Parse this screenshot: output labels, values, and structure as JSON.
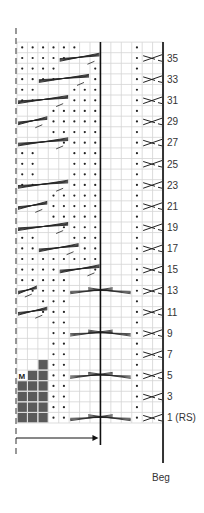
{
  "chart": {
    "columns": 14,
    "rows": 36,
    "grid_origin": {
      "x": 17,
      "y": 423
    },
    "cell_w": 10.43,
    "cell_h": 10.58,
    "divider_after_col": 8,
    "colors": {
      "grid": "#d4d4d4",
      "ink": "#222222",
      "gray_fill": "#5a5a5a"
    },
    "row_labels": [
      {
        "row": 1,
        "text": "1 (RS)"
      },
      {
        "row": 3,
        "text": "3"
      },
      {
        "row": 5,
        "text": "5"
      },
      {
        "row": 7,
        "text": "7"
      },
      {
        "row": 9,
        "text": "9"
      },
      {
        "row": 11,
        "text": "11"
      },
      {
        "row": 13,
        "text": "13"
      },
      {
        "row": 15,
        "text": "15"
      },
      {
        "row": 17,
        "text": "17"
      },
      {
        "row": 19,
        "text": "19"
      },
      {
        "row": 21,
        "text": "21"
      },
      {
        "row": 23,
        "text": "23"
      },
      {
        "row": 25,
        "text": "25"
      },
      {
        "row": 27,
        "text": "27"
      },
      {
        "row": 29,
        "text": "29"
      },
      {
        "row": 31,
        "text": "31"
      },
      {
        "row": 33,
        "text": "33"
      },
      {
        "row": 35,
        "text": "35"
      }
    ],
    "beg_label": "Beg",
    "marker_label": "M",
    "gray_cells": [
      [
        1,
        1
      ],
      [
        1,
        2
      ],
      [
        1,
        3
      ],
      [
        2,
        1
      ],
      [
        2,
        2
      ],
      [
        2,
        3
      ],
      [
        3,
        1
      ],
      [
        3,
        2
      ],
      [
        3,
        3
      ],
      [
        4,
        1
      ],
      [
        4,
        2
      ],
      [
        4,
        3
      ],
      [
        5,
        2
      ],
      [
        5,
        3
      ],
      [
        6,
        3
      ]
    ],
    "marker_cell": [
      5,
      1
    ],
    "dots": {
      "1": [
        4,
        5,
        12
      ],
      "2": [
        4,
        5,
        12
      ],
      "3": [
        4,
        5,
        12
      ],
      "4": [
        4,
        5,
        12
      ],
      "5": [
        4,
        5,
        12
      ],
      "6": [
        4,
        5,
        12
      ],
      "7": [
        4,
        5,
        12
      ],
      "8": [
        4,
        5,
        12
      ],
      "9": [
        4,
        5,
        12
      ],
      "10": [
        4,
        5,
        12
      ],
      "11": [
        3,
        4,
        5,
        12
      ],
      "12": [
        3,
        4,
        5,
        12
      ],
      "13": [
        2,
        3,
        4,
        5,
        12
      ],
      "14": [
        1,
        2,
        3,
        4,
        5,
        12
      ],
      "15": [
        1,
        2,
        3,
        4,
        8,
        12
      ],
      "16": [
        1,
        2,
        3,
        4,
        5,
        6,
        7,
        8,
        12
      ],
      "17": [
        1,
        2,
        7,
        8,
        12
      ],
      "18": [
        1,
        2,
        6,
        7,
        8,
        12
      ],
      "19": [
        5,
        6,
        7,
        8,
        12
      ],
      "20": [
        4,
        5,
        6,
        7,
        8,
        12
      ],
      "21": [
        4,
        5,
        6,
        7,
        8,
        12
      ],
      "22": [
        4,
        5,
        6,
        7,
        8,
        12
      ],
      "23": [
        1,
        2,
        6,
        7,
        8,
        12
      ],
      "24": [
        1,
        2,
        6,
        7,
        8,
        12
      ],
      "25": [
        1,
        2,
        6,
        7,
        8,
        12
      ],
      "26": [
        1,
        2,
        6,
        7,
        8,
        12
      ],
      "27": [
        5,
        6,
        7,
        8,
        12
      ],
      "28": [
        4,
        5,
        6,
        7,
        8,
        12
      ],
      "29": [
        4,
        5,
        6,
        7,
        8,
        12
      ],
      "30": [
        4,
        5,
        6,
        7,
        8,
        12
      ],
      "31": [
        1,
        2,
        6,
        7,
        8,
        12
      ],
      "32": [
        1,
        2,
        6,
        7,
        8,
        12
      ],
      "33": [
        1,
        2,
        3,
        4,
        8,
        12
      ],
      "34": [
        1,
        2,
        3,
        4,
        8,
        12
      ],
      "35": [
        1,
        2,
        3,
        4,
        5,
        12
      ],
      "36": [
        1,
        2,
        3,
        4,
        5,
        6,
        12
      ]
    },
    "left_cables": [
      {
        "row": 11,
        "from": 1,
        "to": 3
      },
      {
        "row": 13,
        "from": 1,
        "to": 2
      },
      {
        "row": 15,
        "from": 5,
        "to": 8
      },
      {
        "row": 17,
        "from": 3,
        "to": 6
      },
      {
        "row": 19,
        "from": 1,
        "to": 5
      },
      {
        "row": 21,
        "from": 1,
        "to": 3
      },
      {
        "row": 23,
        "from": 1,
        "to": 5
      },
      {
        "row": 27,
        "from": 1,
        "to": 5
      },
      {
        "row": 29,
        "from": 1,
        "to": 3
      },
      {
        "row": 31,
        "from": 1,
        "to": 5
      },
      {
        "row": 33,
        "from": 3,
        "to": 7
      },
      {
        "row": 35,
        "from": 5,
        "to": 8
      }
    ],
    "center_cables": [
      {
        "row": 1,
        "from": 6,
        "to": 11
      },
      {
        "row": 5,
        "from": 6,
        "to": 11
      },
      {
        "row": 9,
        "from": 6,
        "to": 11
      },
      {
        "row": 13,
        "from": 6,
        "to": 11
      }
    ],
    "right_cross_rows": [
      1,
      3,
      5,
      7,
      9,
      11,
      13,
      15,
      17,
      19,
      21,
      23,
      25,
      27,
      29,
      31,
      33,
      35
    ],
    "right_cross_cols": [
      13,
      14
    ]
  }
}
